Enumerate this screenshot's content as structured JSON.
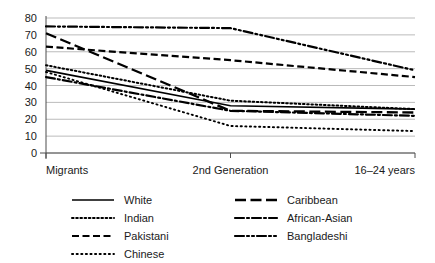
{
  "chart_data": {
    "type": "line",
    "title": "",
    "subtitle": "",
    "xlabel": "",
    "ylabel": "",
    "categories": [
      "Migrants",
      "2nd Generation",
      "16–24 years"
    ],
    "x": [
      0,
      1,
      2
    ],
    "ylim": [
      0,
      80
    ],
    "yticks": [
      0,
      10,
      20,
      30,
      40,
      50,
      60,
      70,
      80
    ],
    "ytick_labels": [
      "0",
      "10",
      "20",
      "30",
      "40",
      "50",
      "60",
      "70",
      "80"
    ],
    "grid": true,
    "grid_axis": "y",
    "legend_position": "bottom",
    "legend_columns": 2,
    "series": [
      {
        "name": "White",
        "values": [
          49,
          28,
          26
        ],
        "dash": "solid"
      },
      {
        "name": "Indian",
        "values": [
          52,
          31,
          26
        ],
        "dash": "dotted"
      },
      {
        "name": "Pakistani",
        "values": [
          63,
          55,
          45
        ],
        "dash": "dashed"
      },
      {
        "name": "Chinese",
        "values": [
          48,
          16,
          13
        ],
        "dash": "fine-dotted"
      },
      {
        "name": "Caribbean",
        "values": [
          71,
          25,
          24
        ],
        "dash": "long-dash"
      },
      {
        "name": "African-Asian",
        "values": [
          45,
          25,
          22
        ],
        "dash": "dash-dot"
      },
      {
        "name": "Bangladeshi",
        "values": [
          75,
          74,
          49
        ],
        "dash": "dash-dot-dot"
      }
    ]
  },
  "legend": {
    "items": [
      {
        "label": "White"
      },
      {
        "label": "Indian"
      },
      {
        "label": "Pakistani"
      },
      {
        "label": "Chinese"
      },
      {
        "label": "Caribbean"
      },
      {
        "label": "African-Asian"
      },
      {
        "label": "Bangladeshi"
      }
    ]
  },
  "colors": {
    "line": "#000000",
    "grid": "#b3b3b3",
    "axis": "#4d4d4d",
    "text": "#1a1a1a",
    "background": "#ffffff"
  }
}
